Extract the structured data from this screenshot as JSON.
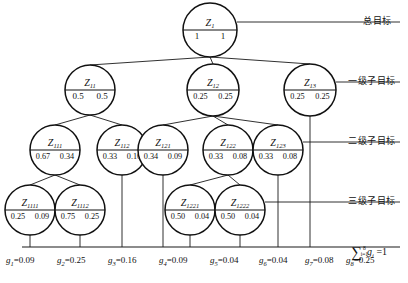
{
  "diagram": {
    "nodes": [
      {
        "id": "Z1",
        "label": "Z",
        "sub": "1",
        "left": "1",
        "right": "1",
        "cx": 210,
        "cy": 30,
        "r": 27
      },
      {
        "id": "Z11",
        "label": "Z",
        "sub": "11",
        "left": "0.5",
        "right": "0.5",
        "cx": 90,
        "cy": 90,
        "r": 25
      },
      {
        "id": "Z12",
        "label": "Z",
        "sub": "12",
        "left": "0.25",
        "right": "0.25",
        "cx": 213,
        "cy": 90,
        "r": 26
      },
      {
        "id": "Z13",
        "label": "Z",
        "sub": "13",
        "left": "0.25",
        "right": "0.25",
        "cx": 310,
        "cy": 90,
        "r": 26
      },
      {
        "id": "Z111",
        "label": "Z",
        "sub": "111",
        "left": "0.67",
        "right": "0.34",
        "cx": 55,
        "cy": 150,
        "r": 25
      },
      {
        "id": "Z112",
        "label": "Z",
        "sub": "112",
        "left": "0.33",
        "right": "0.16",
        "cx": 122,
        "cy": 150,
        "r": 25
      },
      {
        "id": "Z121",
        "label": "Z",
        "sub": "121",
        "left": "0.34",
        "right": "0.09",
        "cx": 163,
        "cy": 150,
        "r": 25
      },
      {
        "id": "Z122",
        "label": "Z",
        "sub": "122",
        "left": "0.33",
        "right": "0.08",
        "cx": 228,
        "cy": 150,
        "r": 25
      },
      {
        "id": "Z123",
        "label": "Z",
        "sub": "123",
        "left": "0.33",
        "right": "0.08",
        "cx": 278,
        "cy": 150,
        "r": 25
      },
      {
        "id": "Z1111",
        "label": "Z",
        "sub": "1111",
        "left": "0.25",
        "right": "0.09",
        "cx": 30,
        "cy": 210,
        "r": 25
      },
      {
        "id": "Z1112",
        "label": "Z",
        "sub": "1112",
        "left": "0.75",
        "right": "0.25",
        "cx": 80,
        "cy": 210,
        "r": 25
      },
      {
        "id": "Z1221",
        "label": "Z",
        "sub": "1221",
        "left": "0.50",
        "right": "0.04",
        "cx": 190,
        "cy": 210,
        "r": 25
      },
      {
        "id": "Z1222",
        "label": "Z",
        "sub": "1222",
        "left": "0.50",
        "right": "0.04",
        "cx": 240,
        "cy": 210,
        "r": 25
      }
    ],
    "edges": [
      {
        "from": "Z1",
        "to": "Z11"
      },
      {
        "from": "Z1",
        "to": "Z12"
      },
      {
        "from": "Z1",
        "to": "Z13"
      },
      {
        "from": "Z11",
        "to": "Z111"
      },
      {
        "from": "Z11",
        "to": "Z112"
      },
      {
        "from": "Z12",
        "to": "Z121"
      },
      {
        "from": "Z12",
        "to": "Z122"
      },
      {
        "from": "Z12",
        "to": "Z123"
      },
      {
        "from": "Z111",
        "to": "Z1111"
      },
      {
        "from": "Z111",
        "to": "Z1112"
      },
      {
        "from": "Z122",
        "to": "Z1221"
      },
      {
        "from": "Z122",
        "to": "Z1222"
      }
    ],
    "drops": [
      {
        "x": 30,
        "fromY": 235
      },
      {
        "x": 80,
        "fromY": 235
      },
      {
        "x": 122,
        "fromY": 175
      },
      {
        "x": 163,
        "fromY": 175
      },
      {
        "x": 190,
        "fromY": 235
      },
      {
        "x": 240,
        "fromY": 235
      },
      {
        "x": 278,
        "fromY": 175
      },
      {
        "x": 310,
        "fromY": 116
      }
    ],
    "baselineY": 247,
    "baselineX1": 22,
    "baselineX2": 400,
    "level_labels": [
      {
        "text": "总目标",
        "y": 14,
        "x": 363,
        "ruleY": 22,
        "ruleX1": 237,
        "ruleX2": 400
      },
      {
        "text": "一级子目标",
        "y": 74,
        "x": 348,
        "ruleY": 82,
        "ruleX1": 336,
        "ruleX2": 400
      },
      {
        "text": "二级子目标",
        "y": 134,
        "x": 348,
        "ruleY": 142,
        "ruleX1": 303,
        "ruleX2": 400
      },
      {
        "text": "三级子目标",
        "y": 194,
        "x": 348,
        "ruleY": 202,
        "ruleX1": 265,
        "ruleX2": 400
      }
    ],
    "g_values": [
      {
        "name": "g",
        "sub": "1",
        "eq": "=",
        "value": "0.09",
        "x": 6
      },
      {
        "name": "g",
        "sub": "2",
        "eq": "=",
        "value": "0.25",
        "x": 57
      },
      {
        "name": "g",
        "sub": "3",
        "eq": "=",
        "value": "0.16",
        "x": 108
      },
      {
        "name": "g",
        "sub": "4",
        "eq": "=",
        "value": "0.09",
        "x": 159
      },
      {
        "name": "g",
        "sub": "5",
        "eq": "=",
        "value": "0.04",
        "x": 210
      },
      {
        "name": "g",
        "sub": "6",
        "eq": "=",
        "value": "0.04",
        "x": 259
      },
      {
        "name": "g",
        "sub": "7",
        "eq": "=",
        "value": "0.08",
        "x": 305
      },
      {
        "name": "g",
        "sub": "8",
        "eq": "=",
        "value": "0.25",
        "x": 346
      }
    ],
    "summation": {
      "upper": "8",
      "lower": "i=1",
      "symbol": "∑",
      "variable": "g",
      "index": "i",
      "equals": "= 1",
      "x": 357,
      "y": 255
    }
  }
}
